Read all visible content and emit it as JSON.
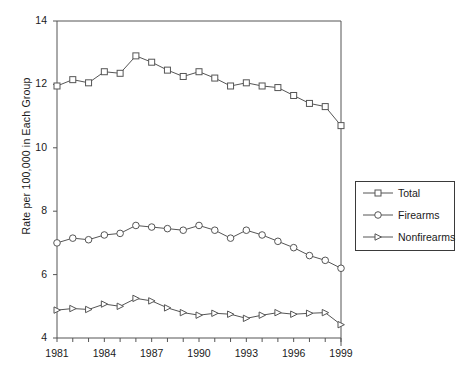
{
  "chart_data": {
    "type": "line",
    "title": "",
    "xlabel": "",
    "ylabel": "Rate per 100,000 in Each Group",
    "xlim": [
      1981,
      1999
    ],
    "ylim": [
      4,
      14
    ],
    "ytick_labels": [
      "4",
      "6",
      "8",
      "10",
      "12",
      "14"
    ],
    "yticks": [
      4,
      6,
      8,
      10,
      12,
      14
    ],
    "xtick_labels": [
      "1981",
      "1984",
      "1987",
      "1990",
      "1993",
      "1996",
      "1999"
    ],
    "xticks": [
      1981,
      1984,
      1987,
      1990,
      1993,
      1996,
      1999
    ],
    "x": [
      1981,
      1982,
      1983,
      1984,
      1985,
      1986,
      1987,
      1988,
      1989,
      1990,
      1991,
      1992,
      1993,
      1994,
      1995,
      1996,
      1997,
      1998,
      1999
    ],
    "grid": false,
    "legend_position": "right",
    "series": [
      {
        "name": "Total",
        "marker": "square",
        "color": "#555555",
        "values": [
          11.95,
          12.15,
          12.05,
          12.4,
          12.35,
          12.9,
          12.7,
          12.45,
          12.25,
          12.4,
          12.2,
          11.95,
          12.05,
          11.95,
          11.9,
          11.65,
          11.4,
          11.3,
          10.7
        ]
      },
      {
        "name": "Firearms",
        "marker": "circle",
        "color": "#555555",
        "values": [
          7.0,
          7.15,
          7.1,
          7.25,
          7.3,
          7.55,
          7.5,
          7.45,
          7.4,
          7.55,
          7.4,
          7.15,
          7.4,
          7.25,
          7.05,
          6.85,
          6.6,
          6.45,
          6.2
        ]
      },
      {
        "name": "Nonfirearms",
        "marker": "triangle",
        "color": "#555555",
        "values": [
          4.88,
          4.93,
          4.9,
          5.07,
          5.0,
          5.25,
          5.17,
          4.95,
          4.8,
          4.72,
          4.78,
          4.75,
          4.62,
          4.72,
          4.8,
          4.75,
          4.78,
          4.8,
          4.42
        ]
      }
    ]
  },
  "legend": {
    "items": [
      {
        "label": "Total",
        "marker": "square"
      },
      {
        "label": "Firearms",
        "marker": "circle"
      },
      {
        "label": "Nonfirearms",
        "marker": "triangle"
      }
    ]
  },
  "axes": {
    "y_axis_title": "Rate per 100,000 in Each Group"
  }
}
